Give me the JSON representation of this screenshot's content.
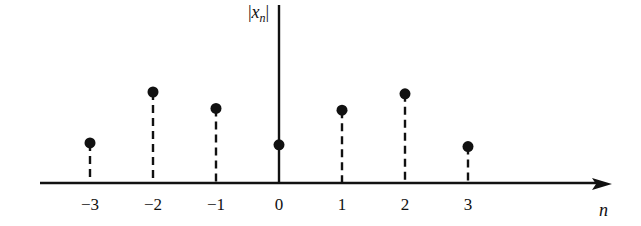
{
  "chart_data": {
    "type": "stem",
    "title": "",
    "xlabel": "n",
    "ylabel": "|x_n|",
    "ylabel_parts": {
      "bar_left": "|",
      "var": "x",
      "sub": "n",
      "bar_right": "|"
    },
    "categories": [
      "−3",
      "−2",
      "−1",
      "0",
      "1",
      "2",
      "3"
    ],
    "x": [
      -3,
      -2,
      -1,
      0,
      1,
      2,
      3
    ],
    "values": [
      0.44,
      1.0,
      0.82,
      0.42,
      0.8,
      0.98,
      0.4
    ],
    "stem_style": "dashed (solid at n=0, lying on vertical axis)",
    "grid": false,
    "legend": null,
    "color": "#111111"
  }
}
